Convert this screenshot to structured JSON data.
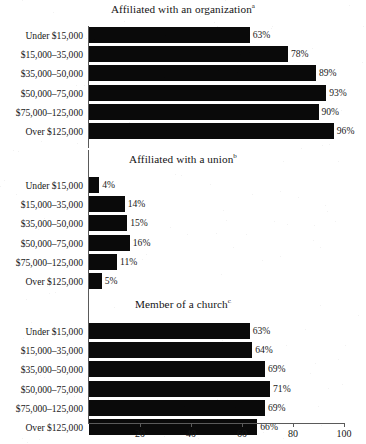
{
  "figure": {
    "background_color": "#ffffff",
    "bar_color": "#0a0a0a",
    "axis_color": "#5a5a5a"
  },
  "chart_data": [
    {
      "type": "bar",
      "orientation": "horizontal",
      "title": "Affiliated with an organization",
      "title_superscript": "a",
      "categories": [
        "Under $15,000",
        "$15,000–35,000",
        "$35,000–50,000",
        "$50,000–75,000",
        "$75,000–125,000",
        "Over $125,000"
      ],
      "values": [
        63,
        78,
        89,
        93,
        90,
        96
      ],
      "value_labels": [
        "63%",
        "78%",
        "89%",
        "93%",
        "90%",
        "96%"
      ],
      "xlabel": "",
      "ylabel": "",
      "xlim": [
        0,
        100
      ],
      "grid": false,
      "legend": false
    },
    {
      "type": "bar",
      "orientation": "horizontal",
      "title": "Affiliated with a union",
      "title_superscript": "b",
      "categories": [
        "Under $15,000",
        "$15,000–35,000",
        "$35,000–50,000",
        "$50,000–75,000",
        "$75,000–125,000",
        "Over $125,000"
      ],
      "values": [
        4,
        14,
        15,
        16,
        11,
        5
      ],
      "value_labels": [
        "4%",
        "14%",
        "15%",
        "16%",
        "11%",
        "5%"
      ],
      "xlabel": "",
      "ylabel": "",
      "xlim": [
        0,
        100
      ],
      "grid": false,
      "legend": false
    },
    {
      "type": "bar",
      "orientation": "horizontal",
      "title": "Member of a church",
      "title_superscript": "c",
      "categories": [
        "Under $15,000",
        "$15,000–35,000",
        "$35,000–50,000",
        "$50,000–75,000",
        "$75,000–125,000",
        "Over $125,000"
      ],
      "values": [
        63,
        64,
        69,
        71,
        69,
        66
      ],
      "value_labels": [
        "63%",
        "64%",
        "69%",
        "71%",
        "69%",
        "66%"
      ],
      "xlabel": "",
      "ylabel": "",
      "xlim": [
        0,
        100
      ],
      "grid": false,
      "legend": false
    }
  ],
  "xaxis": {
    "ticks": [
      20,
      40,
      60,
      80,
      100
    ],
    "tick_labels": [
      "20",
      "40",
      "60",
      "80",
      "100"
    ],
    "min": 0,
    "max": 100
  }
}
